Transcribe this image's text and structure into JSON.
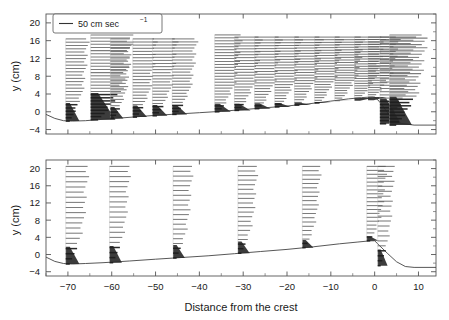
{
  "figure": {
    "xlabel": "Distance from the crest",
    "ylabel": "y (cm)",
    "legend_label": "50 cm sec",
    "legend_exponent": "−1",
    "legend_icon": "velocity-scale-bar-icon"
  },
  "axes": {
    "x_ticks": [
      "−70",
      "−60",
      "−50",
      "−40",
      "−30",
      "−20",
      "−10",
      "0",
      "10"
    ],
    "x_tick_values": [
      -70,
      -60,
      -50,
      -40,
      -30,
      -20,
      -10,
      0,
      10
    ],
    "y_ticks": [
      "20",
      "16",
      "12",
      "8",
      "4",
      "0",
      "−4"
    ],
    "y_tick_values": [
      20,
      16,
      12,
      8,
      4,
      0,
      -4
    ],
    "xlim": [
      -75,
      14
    ],
    "ylim": [
      -5,
      22
    ]
  },
  "chart_data": {
    "type": "line",
    "title": "",
    "xlabel": "Distance from the crest",
    "ylabel": "y (cm)",
    "xlim": [
      -75,
      14
    ],
    "ylim": [
      -5,
      22
    ],
    "grid": false,
    "legend_position": "top-left",
    "legend": [
      "50 cm sec−1"
    ],
    "panels": [
      {
        "name": "upper-panel",
        "terrain": {
          "name": "bed-surface-profile",
          "x": [
            -75,
            -73,
            -71,
            -69,
            -66,
            -62,
            -58,
            -54,
            -50,
            -45,
            -40,
            -35,
            -30,
            -25,
            -20,
            -15,
            -10,
            -6,
            -3,
            -1,
            0,
            1,
            2,
            3,
            4,
            6,
            9,
            14
          ],
          "y": [
            -0.6,
            -1.5,
            -2.0,
            -2.1,
            -2.0,
            -1.7,
            -1.4,
            -1.1,
            -0.8,
            -0.5,
            -0.2,
            0.1,
            0.5,
            0.9,
            1.3,
            1.8,
            2.4,
            2.9,
            3.2,
            3.3,
            3.3,
            2.4,
            1.1,
            -0.3,
            -1.5,
            -2.6,
            -3.0,
            -3.0
          ]
        },
        "profiles": [
          {
            "x": -70.5,
            "base_y": -2.1,
            "top_y": 16.4,
            "n_levels": 26,
            "max_speed": 22,
            "wedge_top_y": 2.0
          },
          {
            "x": -64.8,
            "base_y": -1.8,
            "top_y": 17.3,
            "n_levels": 28,
            "max_speed": 40,
            "wedge_top_y": 4.2
          },
          {
            "x": -60.3,
            "base_y": -1.5,
            "top_y": 16.4,
            "n_levels": 26,
            "max_speed": 21,
            "wedge_top_y": 1.1
          },
          {
            "x": -55.2,
            "base_y": -1.2,
            "top_y": 16.4,
            "n_levels": 26,
            "max_speed": 23,
            "wedge_top_y": 1.4
          },
          {
            "x": -50.7,
            "base_y": -0.9,
            "top_y": 16.4,
            "n_levels": 26,
            "max_speed": 24,
            "wedge_top_y": 1.5
          },
          {
            "x": -46.2,
            "base_y": -0.6,
            "top_y": 16.4,
            "n_levels": 26,
            "max_speed": 24,
            "wedge_top_y": 1.5
          },
          {
            "x": -36.5,
            "base_y": 0.0,
            "top_y": 17.3,
            "n_levels": 27,
            "max_speed": 26,
            "wedge_top_y": 1.8
          },
          {
            "x": -32.0,
            "base_y": 0.3,
            "top_y": 16.8,
            "n_levels": 26,
            "max_speed": 26,
            "wedge_top_y": 1.8
          },
          {
            "x": -27.4,
            "base_y": 0.7,
            "top_y": 16.8,
            "n_levels": 26,
            "max_speed": 26,
            "wedge_top_y": 1.9
          },
          {
            "x": -22.8,
            "base_y": 1.1,
            "top_y": 16.8,
            "n_levels": 26,
            "max_speed": 26,
            "wedge_top_y": 2.0
          },
          {
            "x": -18.3,
            "base_y": 1.5,
            "top_y": 16.8,
            "n_levels": 26,
            "max_speed": 27,
            "wedge_top_y": 2.1
          },
          {
            "x": -13.7,
            "base_y": 2.0,
            "top_y": 16.8,
            "n_levels": 26,
            "max_speed": 27,
            "wedge_top_y": 2.2
          },
          {
            "x": -9.1,
            "base_y": 2.5,
            "top_y": 16.8,
            "n_levels": 26,
            "max_speed": 28,
            "wedge_top_y": 2.4
          },
          {
            "x": -4.6,
            "base_y": 3.1,
            "top_y": 16.8,
            "n_levels": 26,
            "max_speed": 29,
            "wedge_top_y": 2.5
          },
          {
            "x": -1.5,
            "base_y": 3.3,
            "top_y": 16.8,
            "n_levels": 26,
            "max_speed": 30,
            "wedge_top_y": 2.6
          },
          {
            "x": 1.2,
            "base_y": -2.7,
            "top_y": 16.8,
            "n_levels": 28,
            "max_speed": 34,
            "wedge_top_y": 3.0
          },
          {
            "x": 3.4,
            "base_y": -3.0,
            "top_y": 17.3,
            "n_levels": 29,
            "max_speed": 36,
            "wedge_top_y": 3.4
          }
        ]
      },
      {
        "name": "lower-panel",
        "terrain": {
          "name": "bed-surface-profile",
          "x": [
            -75,
            -73,
            -71,
            -69,
            -66,
            -62,
            -56,
            -50,
            -44,
            -38,
            -32,
            -26,
            -20,
            -14,
            -8,
            -4,
            -1,
            0,
            1,
            3,
            5,
            7,
            9,
            14
          ],
          "y": [
            -0.6,
            -1.6,
            -2.1,
            -2.2,
            -2.1,
            -1.9,
            -1.5,
            -1.1,
            -0.7,
            -0.3,
            0.2,
            0.7,
            1.2,
            1.8,
            2.5,
            2.9,
            3.2,
            3.2,
            2.2,
            0.2,
            -1.7,
            -2.8,
            -3.0,
            -3.0
          ]
        },
        "profiles": [
          {
            "x": -70.5,
            "base_y": -2.2,
            "top_y": 20.5,
            "n_levels": 20,
            "max_speed": 22,
            "wedge_top_y": 1.8
          },
          {
            "x": -60.5,
            "base_y": -1.9,
            "top_y": 20.5,
            "n_levels": 20,
            "max_speed": 20,
            "wedge_top_y": 2.0
          },
          {
            "x": -46.0,
            "base_y": -0.8,
            "top_y": 20.5,
            "n_levels": 20,
            "max_speed": 19,
            "wedge_top_y": 2.2
          },
          {
            "x": -31.2,
            "base_y": 0.3,
            "top_y": 20.5,
            "n_levels": 20,
            "max_speed": 19,
            "wedge_top_y": 3.0
          },
          {
            "x": -16.5,
            "base_y": 1.6,
            "top_y": 20.5,
            "n_levels": 20,
            "max_speed": 18,
            "wedge_top_y": 3.4
          },
          {
            "x": -1.8,
            "base_y": 3.2,
            "top_y": 20.5,
            "n_levels": 20,
            "max_speed": 19,
            "wedge_top_y": 4.2
          },
          {
            "x": 0.7,
            "base_y": -2.6,
            "top_y": 20.5,
            "n_levels": 21,
            "max_speed": 16,
            "wedge_top_y": 1.2
          }
        ]
      }
    ]
  }
}
